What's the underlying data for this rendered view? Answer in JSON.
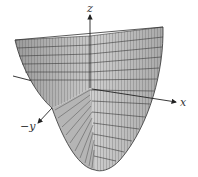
{
  "figure": {
    "type": "3d-surface-plot",
    "surface": "paraboloid opening upward (wireframe mesh, cutaway)",
    "axes": {
      "z_label": "z",
      "x_label": "x",
      "y_label": "−y"
    },
    "colors": {
      "surface_fill": "#bdbdbd",
      "surface_dark": "#8a8a8a",
      "mesh_lines": "#3a3a3a",
      "axis": "#222222",
      "background": "#ffffff"
    }
  }
}
